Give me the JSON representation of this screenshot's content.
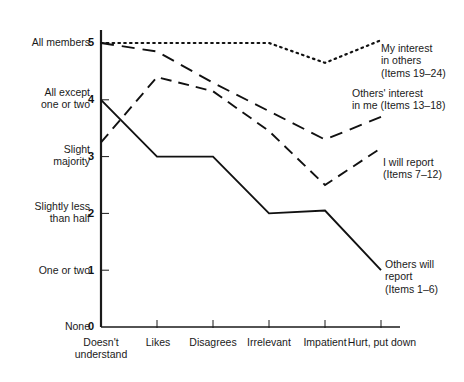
{
  "chart_data": {
    "type": "line",
    "title": "",
    "subtitle": "",
    "xlabel": "",
    "ylabel": "",
    "categories": [
      "Doesn't\nunderstand",
      "Likes",
      "Disagrees",
      "Irrelevant",
      "Impatient",
      "Hurt, put down"
    ],
    "x_tick_labels": [
      "Doesn't understand",
      "Likes",
      "Disagrees",
      "Irrelevant",
      "Impatient",
      "Hurt, put down"
    ],
    "y_tick_values": [
      5,
      4,
      3,
      2,
      1,
      0
    ],
    "y_tick_labels": [
      "5",
      "4",
      "3",
      "2",
      "1",
      "0"
    ],
    "y_category_labels": [
      "All members",
      "All except\none or two",
      "Slight\nmajority",
      "Slightly less\nthan half",
      "One or two",
      "None"
    ],
    "ylim": [
      0,
      5.4
    ],
    "grid": false,
    "legend_position": "right-inline-annotations",
    "series": [
      {
        "name": "My interest in others (Items 19-24)",
        "label_lines": [
          "My interest",
          "in others",
          "(Items 19–24)"
        ],
        "style": "dotted",
        "color": "#111111",
        "values": [
          5,
          5,
          5,
          5,
          4.65,
          5.05
        ]
      },
      {
        "name": "Others' interest in me (Items 13-18)",
        "label_lines": [
          "Others' interest",
          "in me (Items 13–18)"
        ],
        "style": "long-dash",
        "color": "#111111",
        "values": [
          5,
          4.85,
          4.3,
          3.8,
          3.3,
          3.7
        ]
      },
      {
        "name": "I will report (Items 7-12)",
        "label_lines": [
          "I will report",
          "(Items 7–12)"
        ],
        "style": "dash",
        "color": "#111111",
        "values": [
          3.25,
          4.4,
          4.15,
          3.45,
          2.5,
          3.15
        ]
      },
      {
        "name": "Others will report (Items 1-6)",
        "label_lines": [
          "Others will",
          "report",
          "(Items 1–6)"
        ],
        "style": "solid",
        "color": "#111111",
        "values": [
          4,
          3,
          3,
          2,
          2.05,
          1
        ]
      }
    ]
  },
  "y_labels": {
    "l0": "All members",
    "l1": "All except\none or two",
    "l2": "Slight\nmajority",
    "l3": "Slightly less\nthan half",
    "l4": "One or two",
    "l5": "None"
  },
  "y_ticks": {
    "t5": "5",
    "t4": "4",
    "t3": "3",
    "t2": "2",
    "t1": "1",
    "t0": "0"
  },
  "x_ticks": {
    "x0": "Doesn't\nunderstand",
    "x1": "Likes",
    "x2": "Disagrees",
    "x3": "Irrelevant",
    "x4": "Impatient",
    "x5": "Hurt, put down"
  },
  "annotations": {
    "a0": "My interest\nin others\n(Items 19–24)",
    "a1": "Others' interest\nin me (Items 13–18)",
    "a2": "I will report\n(Items 7–12)",
    "a3": "Others will\nreport\n(Items 1–6)"
  }
}
